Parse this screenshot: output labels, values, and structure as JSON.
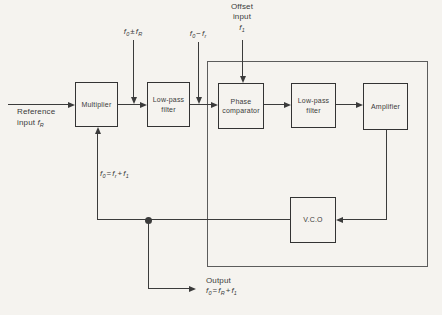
{
  "diagram": {
    "type": "block-diagram",
    "colors": {
      "line": "#3b3b3b",
      "background": "#f5f3ef",
      "text": "#3b3b3b"
    },
    "blocks": {
      "multiplier": {
        "label": "Multiplier"
      },
      "lpf1": {
        "line1": "Low-pass",
        "line2": "filter"
      },
      "phase_comparator": {
        "line1": "Phase",
        "line2": "comparator"
      },
      "lpf2": {
        "line1": "Low-pass",
        "line2": "filter"
      },
      "amplifier": {
        "label": "Amplifier"
      },
      "vco": {
        "label": "V.C.O"
      }
    },
    "labels": {
      "offset": {
        "line1": "Offset",
        "line2": "input",
        "fname": "f",
        "fsub": "1"
      },
      "reference": {
        "line1": "Reference",
        "line2_prefix": "input",
        "fname": "f",
        "fsub": "R"
      },
      "output_title": "Output"
    },
    "formulas": {
      "multiplier_output": {
        "t1": "f",
        "s1": "0",
        "op": "±",
        "t2": "f",
        "s2": "R"
      },
      "filter_output": {
        "t1": "f",
        "s1": "0",
        "op": "−",
        "t2": "f",
        "s2": "r"
      },
      "loop_frequency": {
        "t1": "f",
        "s1": "0",
        "eq": "=",
        "t2": "f",
        "s2": "r",
        "op": "+",
        "t3": "f",
        "s3": "1"
      },
      "output_frequency": {
        "t1": "f",
        "s1": "0",
        "eq": "=",
        "t2": "f",
        "s2": "R",
        "op": "+",
        "t3": "f",
        "s3": "1"
      }
    }
  }
}
